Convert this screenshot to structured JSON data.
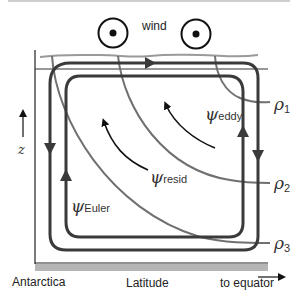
{
  "diagram": {
    "title_top": "wind",
    "labels": {
      "wind": "wind",
      "z_axis": "z",
      "x_left": "Antarctica",
      "x_center": "Latitude",
      "x_right": "to equator"
    },
    "streamfunctions": {
      "eddy": {
        "symbol": "ψ",
        "sub": "eddy"
      },
      "resid": {
        "symbol": "ψ",
        "sub": "resid"
      },
      "euler": {
        "symbol": "ψ",
        "sub": "Euler"
      }
    },
    "isopycnals": [
      {
        "symbol": "ρ",
        "sub": "1"
      },
      {
        "symbol": "ρ",
        "sub": "2"
      },
      {
        "symbol": "ρ",
        "sub": "3"
      }
    ],
    "wind_symbols": [
      "out-of-page",
      "out-of-page"
    ],
    "colors": {
      "loop": "#3a3a3a",
      "isopycnal": "#707070",
      "surface": "#9a9a9a",
      "seafloor": "#b5b5b5",
      "arrow": "#111111"
    }
  }
}
